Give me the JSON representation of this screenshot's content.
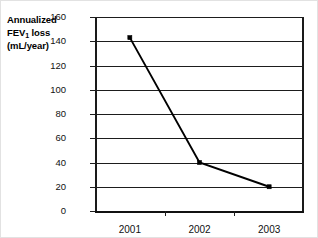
{
  "chart_data": {
    "type": "line",
    "title": "",
    "xlabel": "",
    "ylabel_lines": [
      "Annualized",
      "FEV",
      "1",
      " loss",
      "(mL/year)"
    ],
    "ylabel": "Annualized FEV1 loss (mL/year)",
    "categories": [
      "2001",
      "2002",
      "2003"
    ],
    "values": [
      143,
      40,
      20
    ],
    "series": [
      {
        "name": "Annualized FEV1 loss",
        "values": [
          143,
          40,
          20
        ]
      }
    ],
    "ylim": [
      0,
      160
    ],
    "yticks": [
      0,
      20,
      40,
      60,
      80,
      100,
      120,
      140,
      160
    ],
    "ytick_labels": [
      "0",
      "20",
      "40",
      "60",
      "80",
      "100",
      "120",
      "140",
      "160"
    ],
    "grid": true,
    "grid_axis": "y",
    "legend": "none",
    "marker": "square",
    "line_color": "#000000",
    "grid_color": "#1d1d1d",
    "axis_color": "#111111",
    "background": "#ffffff"
  },
  "axis_title": {
    "line1": "Annualized",
    "line2_pre": "FEV",
    "line2_sub": "1",
    "line2_post": " loss",
    "line3": "(mL/year)"
  }
}
